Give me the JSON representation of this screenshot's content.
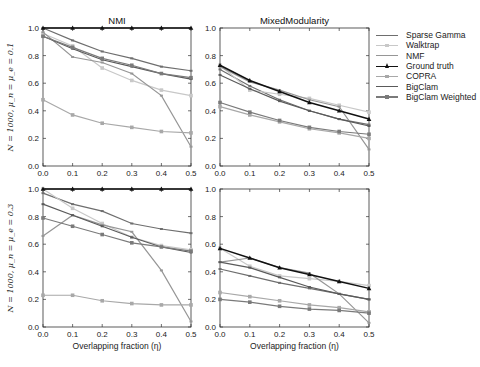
{
  "chart_data": [
    {
      "type": "line",
      "title": "NMI",
      "xlabel": "",
      "ylabel": "N = 1000, μ_n = μ_e = 0.1",
      "xlim": [
        0.0,
        0.5
      ],
      "ylim": [
        0.0,
        1.0
      ],
      "x": [
        0.0,
        0.1,
        0.2,
        0.3,
        0.4,
        0.5
      ],
      "series": [
        {
          "name": "Sparse Gamma",
          "values": [
            1.0,
            0.91,
            0.83,
            0.78,
            0.72,
            0.69
          ]
        },
        {
          "name": "Walktrap",
          "values": [
            0.96,
            0.87,
            0.71,
            0.62,
            0.55,
            0.51
          ]
        },
        {
          "name": "NMF",
          "values": [
            0.97,
            0.79,
            0.75,
            0.67,
            0.51,
            0.14
          ]
        },
        {
          "name": "Ground truth",
          "values": [
            1.0,
            1.0,
            1.0,
            1.0,
            1.0,
            1.0
          ]
        },
        {
          "name": "COPRA",
          "values": [
            0.48,
            0.37,
            0.31,
            0.28,
            0.25,
            0.24
          ]
        },
        {
          "name": "BigClam",
          "values": [
            0.94,
            0.85,
            0.77,
            0.72,
            0.67,
            0.63
          ]
        },
        {
          "name": "BigClam Weighted",
          "values": [
            0.94,
            0.86,
            0.78,
            0.73,
            0.67,
            0.64
          ]
        }
      ]
    },
    {
      "type": "line",
      "title": "MixedModularity",
      "xlim": [
        0.0,
        0.5
      ],
      "ylim": [
        0.0,
        1.0
      ],
      "x": [
        0.0,
        0.1,
        0.2,
        0.3,
        0.4,
        0.5
      ],
      "series": [
        {
          "name": "Sparse Gamma",
          "values": [
            0.7,
            0.58,
            0.48,
            0.4,
            0.34,
            0.3
          ]
        },
        {
          "name": "Walktrap",
          "values": [
            0.73,
            0.55,
            0.52,
            0.49,
            0.44,
            0.39
          ]
        },
        {
          "name": "NMF",
          "values": [
            0.72,
            0.61,
            0.55,
            0.48,
            0.43,
            0.12
          ]
        },
        {
          "name": "Ground truth",
          "values": [
            0.73,
            0.62,
            0.54,
            0.46,
            0.4,
            0.34
          ]
        },
        {
          "name": "COPRA",
          "values": [
            0.43,
            0.37,
            0.32,
            0.27,
            0.24,
            0.2
          ]
        },
        {
          "name": "BigClam",
          "values": [
            0.66,
            0.56,
            0.47,
            0.4,
            0.34,
            0.29
          ]
        },
        {
          "name": "BigClam Weighted",
          "values": [
            0.46,
            0.39,
            0.33,
            0.28,
            0.25,
            0.23
          ]
        }
      ]
    },
    {
      "type": "line",
      "title": "",
      "xlabel": "Overlapping fraction (η)",
      "ylabel": "N = 1000, μ_n = μ_e = 0.3",
      "xlim": [
        0.0,
        0.5
      ],
      "ylim": [
        0.0,
        1.0
      ],
      "x": [
        0.0,
        0.1,
        0.2,
        0.3,
        0.4,
        0.5
      ],
      "series": [
        {
          "name": "Sparse Gamma",
          "values": [
            0.97,
            0.89,
            0.84,
            0.75,
            0.71,
            0.68
          ]
        },
        {
          "name": "Walktrap",
          "values": [
            1.0,
            0.86,
            0.75,
            0.65,
            0.59,
            0.56
          ]
        },
        {
          "name": "NMF",
          "values": [
            0.66,
            0.81,
            0.74,
            0.69,
            0.41,
            0.04
          ]
        },
        {
          "name": "Ground truth",
          "values": [
            1.0,
            1.0,
            1.0,
            1.0,
            1.0,
            1.0
          ]
        },
        {
          "name": "COPRA",
          "values": [
            0.23,
            0.23,
            0.19,
            0.17,
            0.16,
            0.16
          ]
        },
        {
          "name": "BigClam",
          "values": [
            0.89,
            0.81,
            0.73,
            0.65,
            0.58,
            0.54
          ]
        },
        {
          "name": "BigClam Weighted",
          "values": [
            0.79,
            0.73,
            0.67,
            0.61,
            0.58,
            0.55
          ]
        }
      ]
    },
    {
      "type": "line",
      "title": "",
      "xlabel": "Overlapping fraction (η)",
      "xlim": [
        0.0,
        0.5
      ],
      "ylim": [
        0.0,
        1.0
      ],
      "x": [
        0.0,
        0.1,
        0.2,
        0.3,
        0.4,
        0.5
      ],
      "series": [
        {
          "name": "Sparse Gamma",
          "values": [
            0.42,
            0.37,
            0.32,
            0.28,
            0.24,
            0.2
          ]
        },
        {
          "name": "Walktrap",
          "values": [
            0.57,
            0.44,
            0.37,
            0.35,
            0.33,
            0.3
          ]
        },
        {
          "name": "NMF",
          "values": [
            0.47,
            0.5,
            0.43,
            0.39,
            0.24,
            0.03
          ]
        },
        {
          "name": "Ground truth",
          "values": [
            0.57,
            0.5,
            0.43,
            0.38,
            0.33,
            0.28
          ]
        },
        {
          "name": "COPRA",
          "values": [
            0.25,
            0.22,
            0.19,
            0.16,
            0.14,
            0.11
          ]
        },
        {
          "name": "BigClam",
          "values": [
            0.47,
            0.43,
            0.36,
            0.29,
            0.24,
            0.2
          ]
        },
        {
          "name": "BigClam Weighted",
          "values": [
            0.2,
            0.18,
            0.15,
            0.13,
            0.12,
            0.1
          ]
        }
      ]
    }
  ],
  "legend": {
    "items": [
      {
        "label": "Sparse Gamma",
        "color": "#6e6e6e",
        "width": 1.2,
        "marker": "tick"
      },
      {
        "label": "Walktrap",
        "color": "#c8c8c8",
        "width": 1.2,
        "marker": "square"
      },
      {
        "label": "NMF",
        "color": "#969696",
        "width": 1.2,
        "marker": "tick"
      },
      {
        "label": "Ground truth",
        "color": "#111111",
        "width": 1.5,
        "marker": "triangle"
      },
      {
        "label": "COPRA",
        "color": "#a8a8a8",
        "width": 1.2,
        "marker": "square"
      },
      {
        "label": "BigClam",
        "color": "#5a5a5a",
        "width": 1.2,
        "marker": "tick"
      },
      {
        "label": "BigClam Weighted",
        "color": "#7a7a7a",
        "width": 1.2,
        "marker": "square"
      }
    ]
  },
  "axes": {
    "xticks": [
      "0.0",
      "0.1",
      "0.2",
      "0.3",
      "0.4",
      "0.5"
    ],
    "yticks": [
      "0.0",
      "0.2",
      "0.4",
      "0.6",
      "0.8",
      "1.0"
    ]
  }
}
